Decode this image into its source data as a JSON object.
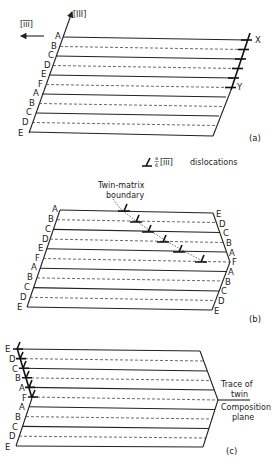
{
  "figure": {
    "panel_a": {
      "label": "(a)",
      "axis_direction": "[III]",
      "shear_direction": "[īīī]",
      "stacking_left": [
        "A",
        "B",
        "C",
        "D",
        "E",
        "F",
        "A",
        "B",
        "C",
        "D",
        "E"
      ],
      "markers": {
        "top": "X",
        "bottom": "Y"
      }
    },
    "legend": {
      "symbol": "⊥",
      "fraction_num": "a",
      "fraction_den": "6",
      "direction": "[īīī]",
      "text": "dislocations"
    },
    "panel_b": {
      "label": "(b)",
      "annotation_line1": "Twin-matrix",
      "annotation_line2": "boundary",
      "stacking_left": [
        "A",
        "B",
        "C",
        "D",
        "E",
        "F",
        "A",
        "B",
        "C",
        "D",
        "E"
      ],
      "stacking_right": [
        "E",
        "D",
        "C",
        "B",
        "A",
        "F",
        "A",
        "B",
        "C",
        "D",
        "E"
      ]
    },
    "panel_c": {
      "label": "(c)",
      "stacking_left": [
        "E",
        "D",
        "C",
        "B",
        "A",
        "F",
        "A",
        "B",
        "C",
        "D",
        "E"
      ],
      "annotation_top_1": "Trace of",
      "annotation_top_2": "twin",
      "annotation_bottom_1": "Composition",
      "annotation_bottom_2": "plane"
    }
  }
}
